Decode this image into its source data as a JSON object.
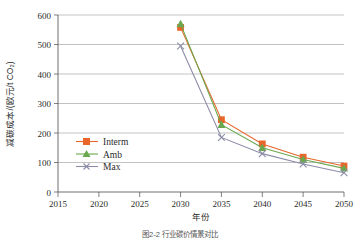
{
  "figure": {
    "caption": "图2-2  行业碳价情景对比",
    "y_axis_label": "减碳成本/(欧元/t CO₂)",
    "x_axis_label": "年份"
  },
  "colors": {
    "interm": "#E8662A",
    "amb": "#6AA84F",
    "max": "#8C8CA8",
    "grid": "#9a9a9a",
    "axis": "#4a4a4a",
    "background": "#ffffff"
  },
  "legend": {
    "position": "inside-left",
    "entries": [
      {
        "label": "Interm",
        "marker": "square-marker",
        "color": "#E8662A"
      },
      {
        "label": "Amb",
        "marker": "triangle-marker",
        "color": "#6AA84F"
      },
      {
        "label": "Max",
        "marker": "x-marker",
        "color": "#8C8CA8"
      }
    ]
  },
  "chart_data": {
    "type": "line",
    "title": "",
    "xlabel": "年份",
    "ylabel": "减碳成本/(欧元/t CO₂)",
    "xlim": [
      2015,
      2050
    ],
    "ylim": [
      0,
      600
    ],
    "xticks": [
      2015,
      2020,
      2025,
      2030,
      2035,
      2040,
      2045,
      2050
    ],
    "yticks": [
      0,
      100,
      200,
      300,
      400,
      500,
      600
    ],
    "grid": "horizontal",
    "x": [
      2030,
      2035,
      2040,
      2045,
      2050
    ],
    "series": [
      {
        "name": "Interm",
        "color": "#E8662A",
        "marker": "square",
        "values": [
          558,
          245,
          163,
          118,
          88
        ]
      },
      {
        "name": "Amb",
        "color": "#6AA84F",
        "marker": "triangle",
        "values": [
          570,
          228,
          150,
          110,
          80
        ]
      },
      {
        "name": "Max",
        "color": "#8C8CA8",
        "marker": "x",
        "values": [
          495,
          185,
          130,
          95,
          65
        ]
      }
    ]
  },
  "axis_tick_text": {
    "y": [
      "600",
      "500",
      "400",
      "300",
      "200",
      "100",
      "0"
    ],
    "x": [
      "2015",
      "2020",
      "2025",
      "2030",
      "2035",
      "2040",
      "2045",
      "2050"
    ]
  }
}
